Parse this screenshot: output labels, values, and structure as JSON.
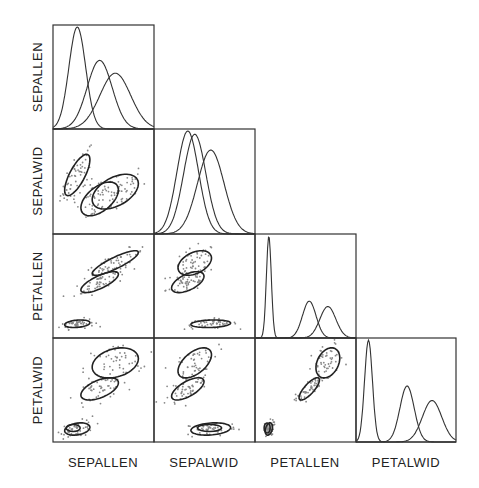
{
  "chart_data": {
    "type": "scatter",
    "title": "",
    "layout": "lower-triangular scatterplot matrix with density curves on diagonal",
    "variables": [
      "SEPALLEN",
      "SEPALWID",
      "PETALLEN",
      "PETALWID"
    ],
    "axis_ranges": {
      "SEPALLEN": [
        4.0,
        8.2
      ],
      "SEPALWID": [
        1.8,
        4.7
      ],
      "PETALLEN": [
        0.5,
        7.5
      ],
      "PETALWID": [
        -0.1,
        2.7
      ]
    },
    "groups": [
      {
        "name": "Setosa",
        "means": {
          "SEPALLEN": 5.01,
          "SEPALWID": 3.43,
          "PETALLEN": 1.46,
          "PETALWID": 0.25
        },
        "sds": {
          "SEPALLEN": 0.35,
          "SEPALWID": 0.38,
          "PETALLEN": 0.17,
          "PETALWID": 0.11
        }
      },
      {
        "name": "Versicolor",
        "means": {
          "SEPALLEN": 5.94,
          "SEPALWID": 2.77,
          "PETALLEN": 4.26,
          "PETALWID": 1.33
        },
        "sds": {
          "SEPALLEN": 0.52,
          "SEPALWID": 0.31,
          "PETALLEN": 0.47,
          "PETALWID": 0.2
        }
      },
      {
        "name": "Virginica",
        "means": {
          "SEPALLEN": 6.59,
          "SEPALWID": 2.97,
          "PETALLEN": 5.55,
          "PETALWID": 2.03
        },
        "sds": {
          "SEPALLEN": 0.64,
          "SEPALWID": 0.32,
          "PETALLEN": 0.55,
          "PETALWID": 0.27
        }
      }
    ],
    "correlations": {
      "Setosa": {
        "SEPALWID|SEPALLEN": 0.74,
        "PETALLEN|SEPALLEN": 0.27,
        "PETALLEN|SEPALWID": 0.18,
        "PETALWID|SEPALLEN": 0.28,
        "PETALWID|SEPALWID": 0.23,
        "PETALWID|PETALLEN": 0.33
      },
      "Versicolor": {
        "SEPALWID|SEPALLEN": 0.53,
        "PETALLEN|SEPALLEN": 0.75,
        "PETALLEN|SEPALWID": 0.56,
        "PETALWID|SEPALLEN": 0.55,
        "PETALWID|SEPALWID": 0.66,
        "PETALWID|PETALLEN": 0.79
      },
      "Virginica": {
        "SEPALWID|SEPALLEN": 0.46,
        "PETALLEN|SEPALLEN": 0.86,
        "PETALLEN|SEPALWID": 0.4,
        "PETALWID|SEPALLEN": 0.28,
        "PETALWID|SEPALWID": 0.54,
        "PETALWID|PETALLEN": 0.32
      }
    },
    "points_per_group": 50,
    "legend": "none",
    "grid": false,
    "xlabels": [
      "SEPALLEN",
      "SEPALWID",
      "PETALLEN",
      "PETALWID"
    ],
    "ylabels": [
      "SEPALLEN",
      "SEPALWID",
      "PETALLEN",
      "PETALWID"
    ]
  }
}
